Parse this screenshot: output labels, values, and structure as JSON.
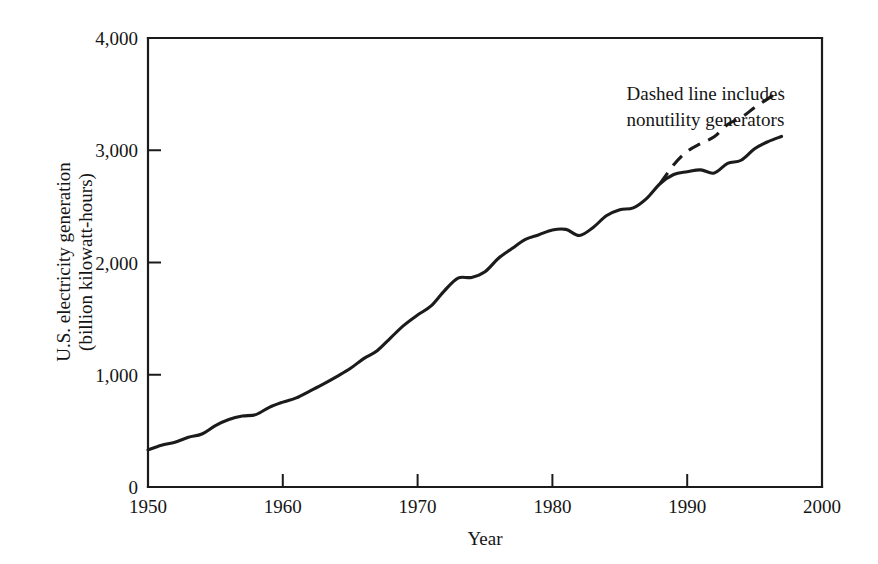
{
  "chart_data": {
    "type": "line",
    "title": "",
    "xlabel": "Year",
    "ylabel": "U.S. electricity generation (billion kilowatt-hours)",
    "ylabel_line1": "U.S. electricity generation",
    "ylabel_line2": "(billion kilowatt-hours)",
    "xlim": [
      1950,
      2000
    ],
    "ylim": [
      0,
      4000
    ],
    "grid": false,
    "legend": "none",
    "xticks": [
      1950,
      1960,
      1970,
      1980,
      1990,
      2000
    ],
    "xtick_labels": [
      "1950",
      "1960",
      "1970",
      "1980",
      "1990",
      "2000"
    ],
    "yticks": [
      0,
      1000,
      2000,
      3000,
      4000
    ],
    "ytick_labels": [
      "0",
      "1,000",
      "2,000",
      "3,000",
      "4,000"
    ],
    "annotations": [
      {
        "name": "dashed-line-note",
        "line1": "Dashed line includes",
        "line2": "nonutility generators",
        "x": 1985.5,
        "y": 3450
      }
    ],
    "series": [
      {
        "name": "Utility generation",
        "style": "solid",
        "x": [
          1950,
          1951,
          1952,
          1953,
          1954,
          1955,
          1956,
          1957,
          1958,
          1959,
          1960,
          1961,
          1962,
          1963,
          1964,
          1965,
          1966,
          1967,
          1968,
          1969,
          1970,
          1971,
          1972,
          1973,
          1974,
          1975,
          1976,
          1977,
          1978,
          1979,
          1980,
          1981,
          1982,
          1983,
          1984,
          1985,
          1986,
          1987,
          1988,
          1989,
          1990,
          1991,
          1992,
          1993,
          1994,
          1995,
          1996,
          1997
        ],
        "values": [
          330,
          371,
          399,
          443,
          472,
          547,
          601,
          632,
          645,
          710,
          756,
          794,
          855,
          917,
          984,
          1055,
          1144,
          1214,
          1329,
          1442,
          1532,
          1613,
          1750,
          1861,
          1867,
          1918,
          2038,
          2124,
          2206,
          2247,
          2290,
          2295,
          2241,
          2310,
          2416,
          2470,
          2487,
          2572,
          2704,
          2784,
          2808,
          2825,
          2797,
          2883,
          2911,
          3013,
          3077,
          3123
        ]
      },
      {
        "name": "Total including nonutility generators",
        "style": "dashed",
        "x": [
          1988,
          1989,
          1990,
          1991,
          1992,
          1993,
          1994,
          1995,
          1996,
          1997
        ],
        "values": [
          2704,
          2870,
          2990,
          3060,
          3120,
          3230,
          3290,
          3380,
          3460,
          3530
        ]
      }
    ]
  },
  "figure": {
    "background_color": "#ffffff",
    "line_color": "#1b1b1b"
  }
}
